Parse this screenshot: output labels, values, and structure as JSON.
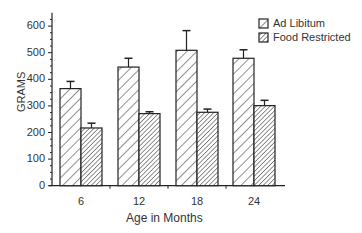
{
  "chart_data": {
    "type": "bar",
    "title": "",
    "xlabel": "Age in Months",
    "ylabel": "GRAMS",
    "ylim": [
      0,
      600
    ],
    "yticks": [
      0,
      100,
      200,
      300,
      400,
      500,
      600
    ],
    "categories": [
      "6",
      "12",
      "18",
      "24"
    ],
    "series": [
      {
        "name": "Ad Libitum",
        "pattern": "sparse-hatch",
        "values": [
          365,
          446,
          509,
          479
        ],
        "error_upper": [
          392,
          479,
          583,
          511
        ]
      },
      {
        "name": "Food Restricted",
        "pattern": "dense-hatch",
        "values": [
          217,
          271,
          276,
          301
        ],
        "error_upper": [
          235,
          278,
          288,
          321
        ]
      }
    ],
    "legend_position": "top-right",
    "grid": false
  }
}
